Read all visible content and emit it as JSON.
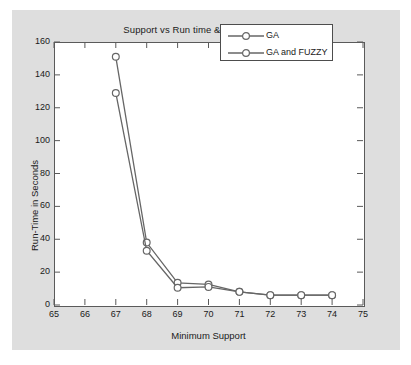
{
  "chart_data": {
    "type": "line",
    "title": "Support vs Run time & Confidence=95",
    "xlabel": "Minimum Support",
    "ylabel": "Run-Time in Seconds",
    "xlim": [
      65,
      75
    ],
    "ylim": [
      0,
      160
    ],
    "xticks": [
      65,
      66,
      67,
      68,
      69,
      70,
      71,
      72,
      73,
      74,
      75
    ],
    "yticks": [
      0,
      20,
      40,
      60,
      80,
      100,
      120,
      140,
      160
    ],
    "grid": false,
    "legend_position": "top-right",
    "x": [
      67,
      68,
      69,
      70,
      71,
      72,
      73,
      74
    ],
    "series": [
      {
        "name": "GA",
        "values": [
          151,
          38,
          13.5,
          12.5,
          8,
          6,
          6,
          6
        ],
        "color": "#666666",
        "marker": "circle"
      },
      {
        "name": "GA and FUZZY",
        "values": [
          129,
          33,
          10.5,
          11,
          8,
          6,
          6,
          6
        ],
        "color": "#666666",
        "marker": "circle"
      }
    ]
  },
  "figure": {
    "background_color": "#dedede",
    "axes_background_color": "#ffffff",
    "axis_color": "#5a5a5a",
    "text_color": "#1a1a1a"
  },
  "legend": {
    "entries": [
      {
        "label": "GA"
      },
      {
        "label": "GA and FUZZY"
      }
    ]
  }
}
